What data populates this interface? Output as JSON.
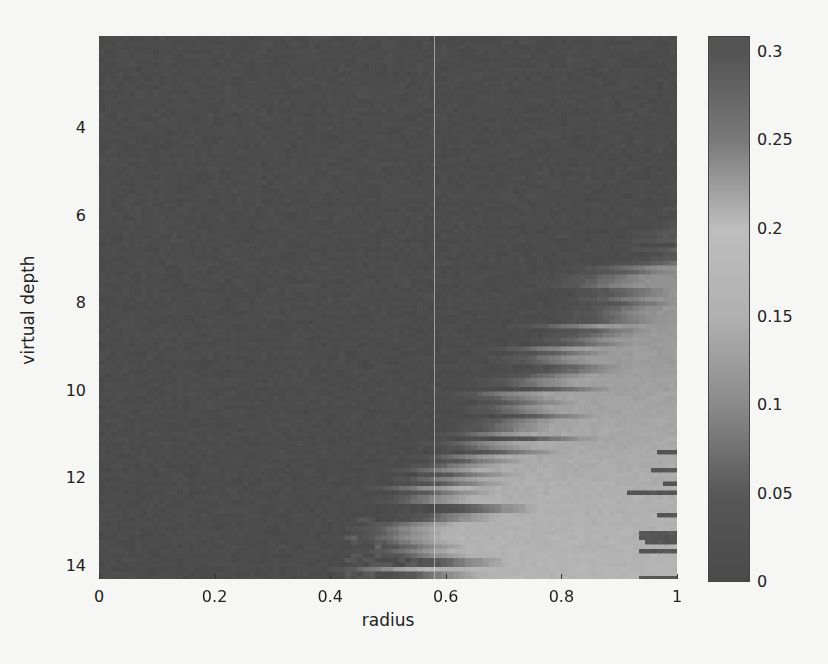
{
  "chart_data": {
    "type": "heatmap",
    "title": "",
    "xlabel": "radius",
    "ylabel": "virtual depth",
    "xlim": [
      0,
      1
    ],
    "ylim": [
      14.3,
      1.9
    ],
    "y_axis_direction": "down",
    "x_ticks": [
      "0",
      "0.2",
      "0.4",
      "0.6",
      "0.8",
      "1"
    ],
    "y_ticks": [
      "4",
      "6",
      "8",
      "10",
      "12",
      "14"
    ],
    "colorbar": {
      "range": [
        0,
        0.3
      ],
      "ticks": [
        "0",
        "0.05",
        "0.1",
        "0.15",
        "0.2",
        "0.25",
        "0.3"
      ],
      "colormap": "jet (grayscale rendering)"
    },
    "grid": false,
    "rows_depth": [
      7,
      7.5,
      8,
      8.5,
      9,
      9.5,
      10,
      10.5,
      11,
      11.5,
      12,
      12.5,
      13,
      13.5,
      14
    ],
    "bright_onset_radius": [
      0.95,
      0.92,
      0.88,
      0.85,
      0.82,
      0.8,
      0.78,
      0.75,
      0.72,
      0.7,
      0.66,
      0.63,
      0.6,
      0.58,
      0.57
    ],
    "peak_value_estimate": 0.16
  },
  "axes": {
    "xlabel": "radius",
    "ylabel": "virtual depth",
    "x_ticks": [
      {
        "label": "0",
        "value": 0
      },
      {
        "label": "0.2",
        "value": 0.2
      },
      {
        "label": "0.4",
        "value": 0.4
      },
      {
        "label": "0.6",
        "value": 0.6
      },
      {
        "label": "0.8",
        "value": 0.8
      },
      {
        "label": "1",
        "value": 1
      }
    ],
    "y_ticks": [
      {
        "label": "4",
        "value": 4
      },
      {
        "label": "6",
        "value": 6
      },
      {
        "label": "8",
        "value": 8
      },
      {
        "label": "10",
        "value": 10
      },
      {
        "label": "12",
        "value": 12
      },
      {
        "label": "14",
        "value": 14
      }
    ]
  },
  "colorbar": {
    "ticks": [
      {
        "label": "0.3",
        "value": 0.3
      },
      {
        "label": "0.25",
        "value": 0.25
      },
      {
        "label": "0.2",
        "value": 0.2
      },
      {
        "label": "0.15",
        "value": 0.15
      },
      {
        "label": "0.1",
        "value": 0.1
      },
      {
        "label": "0.05",
        "value": 0.05
      },
      {
        "label": "0",
        "value": 0
      }
    ]
  }
}
